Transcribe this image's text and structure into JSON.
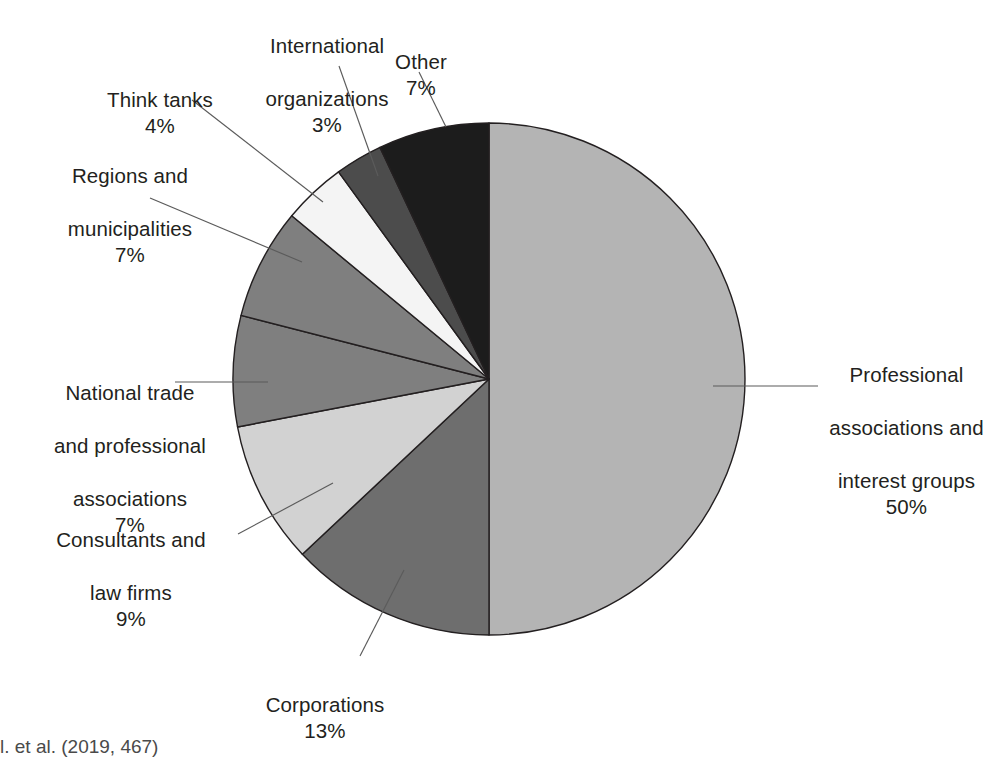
{
  "chart_data": {
    "type": "pie",
    "title": "",
    "subtitle": "",
    "xlabel": "",
    "ylabel": "",
    "legend_position": "none",
    "grid": false,
    "start_angle_deg": 0,
    "direction": "counterclockwise",
    "categories": [
      "Professional associations and interest groups",
      "Corporations",
      "Consultants and law firms",
      "National trade and professional associations",
      "Regions and municipalities",
      "Think tanks",
      "International organizations",
      "Other"
    ],
    "values": [
      50,
      13,
      9,
      7,
      7,
      4,
      3,
      7
    ],
    "unit": "%",
    "slices": [
      {
        "key": "professional",
        "label_lines": [
          "Professional",
          "associations and",
          "interest groups"
        ],
        "label_text": "Professional associations and interest groups",
        "percent_text": "50%",
        "value": 50,
        "color": "#b4b4b4"
      },
      {
        "key": "corporations",
        "label_lines": [
          "Corporations"
        ],
        "label_text": "Corporations",
        "percent_text": "13%",
        "value": 13,
        "color": "#6e6e6e"
      },
      {
        "key": "consultants",
        "label_lines": [
          "Consultants and",
          "law firms"
        ],
        "label_text": "Consultants and law firms",
        "percent_text": "9%",
        "value": 9,
        "color": "#d2d2d2"
      },
      {
        "key": "national-trade",
        "label_lines": [
          "National trade",
          "and professional",
          "associations"
        ],
        "label_text": "National trade and professional associations",
        "percent_text": "7%",
        "value": 7,
        "color": "#7f7f7f"
      },
      {
        "key": "regions",
        "label_lines": [
          "Regions and",
          "municipalities"
        ],
        "label_text": "Regions and municipalities",
        "percent_text": "7%",
        "value": 7,
        "color": "#7f7f7f"
      },
      {
        "key": "think-tanks",
        "label_lines": [
          "Think tanks"
        ],
        "label_text": "Think tanks",
        "percent_text": "4%",
        "value": 4,
        "color": "#f4f4f4"
      },
      {
        "key": "international",
        "label_lines": [
          "International",
          "organizations"
        ],
        "label_text": "International organizations",
        "percent_text": "3%",
        "value": 3,
        "color": "#4c4c4c"
      },
      {
        "key": "other",
        "label_lines": [
          "Other"
        ],
        "label_text": "Other",
        "percent_text": "7%",
        "value": 7,
        "color": "#1c1c1c"
      }
    ]
  },
  "labels": {
    "professional": {
      "line1": "Professional",
      "line2": "associations and",
      "line3": "interest groups",
      "pct": "50%"
    },
    "corporations": {
      "line1": "Corporations",
      "pct": "13%"
    },
    "consultants": {
      "line1": "Consultants and",
      "line2": "law firms",
      "pct": "9%"
    },
    "national": {
      "line1": "National trade",
      "line2": "and professional",
      "line3": "associations",
      "pct": "7%"
    },
    "regions": {
      "line1": "Regions and",
      "line2": "municipalities",
      "pct": "7%"
    },
    "think": {
      "line1": "Think tanks",
      "pct": "4%"
    },
    "international": {
      "line1": "International",
      "line2": "organizations",
      "pct": "3%"
    },
    "other": {
      "line1": "Other",
      "pct": "7%"
    }
  },
  "source": {
    "text": "l. et al. (2019, 467)",
    "clipped": true
  },
  "geometry": {
    "center_x": 489,
    "center_y": 379,
    "radius": 256
  },
  "colors": {
    "outline": "#231f20",
    "leader_line": "#5b5b5b",
    "text": "#231f20",
    "background": "#ffffff"
  }
}
